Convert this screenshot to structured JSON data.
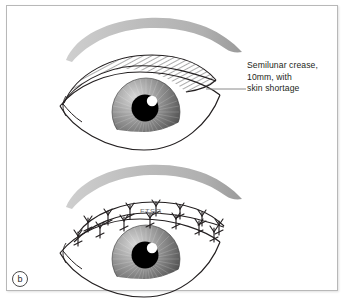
{
  "figure": {
    "panel_label": "b",
    "background_color": "#ffffff",
    "border_color": "#b8b8b8",
    "ink_color": "#231f20"
  },
  "annotation": {
    "lines": [
      "Semilunar crease,",
      "10mm, with",
      "skin shortage"
    ],
    "leader_line_color": "#8a8a8a"
  },
  "panels": [
    {
      "name": "upper-eye-preop",
      "caption": "Eye with hatched semilunar crease marking above upper lid",
      "eyebrow_color": "#b5b5b5",
      "crease_hatching": "diagonal",
      "iris_color_light": "#c9c9c9",
      "iris_color_dark": "#4d4d4d",
      "pupil_color": "#000000",
      "catchlight_color": "#ffffff"
    },
    {
      "name": "lower-eye-postop",
      "caption": "Eye with full thickness skin graft sutured into upper lid",
      "graft_label": "FTSG",
      "eyebrow_color": "#b5b5b5",
      "suture_count": 14,
      "iris_color_light": "#c9c9c9",
      "iris_color_dark": "#4d4d4d",
      "pupil_color": "#000000",
      "catchlight_color": "#ffffff"
    }
  ]
}
